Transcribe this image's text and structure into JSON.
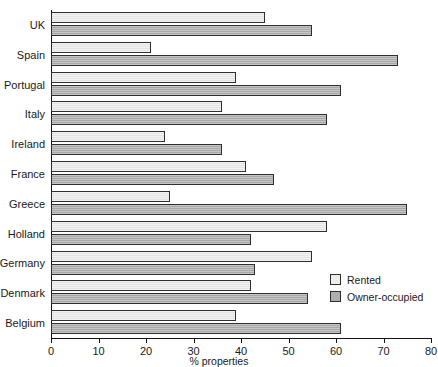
{
  "chart_data": {
    "type": "bar",
    "orientation": "horizontal",
    "title": "",
    "xlabel": "% properties",
    "ylabel": "",
    "xlim": [
      0,
      80
    ],
    "xticks": [
      0,
      10,
      20,
      30,
      40,
      50,
      60,
      70,
      80
    ],
    "grid": false,
    "legend_position": "bottom-right",
    "categories": [
      "UK",
      "Spain",
      "Portugal",
      "Italy",
      "Ireland",
      "France",
      "Greece",
      "Holland",
      "Germany",
      "Denmark",
      "Belgium"
    ],
    "series": [
      {
        "name": "Rented",
        "color": "#ededed",
        "values": [
          45,
          21,
          39,
          36,
          24,
          41,
          25,
          58,
          55,
          42,
          39
        ]
      },
      {
        "name": "Owner-occupied",
        "color": "#aeaeae",
        "values": [
          55,
          73,
          61,
          58,
          36,
          47,
          75,
          42,
          43,
          54,
          61
        ]
      }
    ]
  },
  "legend": {
    "items": [
      {
        "label": "Rented",
        "swatch": "rented"
      },
      {
        "label": "Owner-occupied",
        "swatch": "owner"
      }
    ]
  }
}
